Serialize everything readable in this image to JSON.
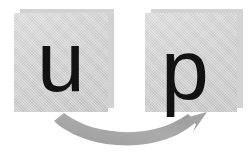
{
  "figure": {
    "type": "diagram",
    "title": "",
    "background_color": "#ffffff"
  },
  "tiles": [
    {
      "id": "tile-u",
      "letter": "u",
      "letter_color": "#121212",
      "tile_color": "#d0d0d0",
      "shadow_color": "#d2d2d2",
      "x": 14,
      "y": 13,
      "width": 94,
      "height": 99
    },
    {
      "id": "tile-p",
      "letter": "p",
      "letter_color": "#121212",
      "tile_color": "#d0d0d0",
      "shadow_color": "#d2d2d2",
      "x": 145,
      "y": 13,
      "width": 92,
      "height": 99
    }
  ],
  "arrow": {
    "name": "curved-arrow",
    "color": "#a6a6a6",
    "direction": "left-to-right-upward",
    "from_tile": "tile-u",
    "to_tile": "tile-p",
    "label": ""
  }
}
